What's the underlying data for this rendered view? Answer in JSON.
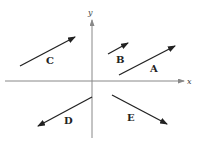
{
  "axes": {
    "x_label": "x",
    "y_label": "y",
    "color": "#888888"
  },
  "vector_color": "#222222",
  "vectors": [
    {
      "label": "A",
      "from": [
        119,
        75
      ],
      "to": [
        175,
        46
      ],
      "label_pos": [
        150,
        72
      ]
    },
    {
      "label": "B",
      "from": [
        108,
        54
      ],
      "to": [
        128,
        43
      ],
      "label_pos": [
        116,
        63
      ]
    },
    {
      "label": "C",
      "from": [
        20,
        66
      ],
      "to": [
        75,
        37
      ],
      "label_pos": [
        46,
        64
      ]
    },
    {
      "label": "D",
      "from": [
        92,
        97
      ],
      "to": [
        38,
        126
      ],
      "label_pos": [
        64,
        124
      ]
    },
    {
      "label": "E",
      "from": [
        112,
        95
      ],
      "to": [
        167,
        124
      ],
      "label_pos": [
        127,
        121
      ]
    }
  ]
}
